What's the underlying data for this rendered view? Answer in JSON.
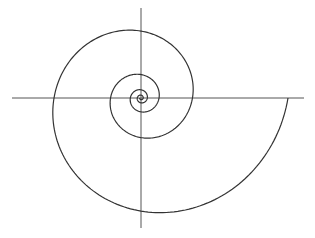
{
  "diagram": {
    "type": "logarithmic-spiral",
    "background": "#ffffff",
    "stroke_color": "#333333",
    "axis_color": "#555555",
    "center": [
      141,
      98
    ],
    "horizontal_axis": {
      "x1": 12,
      "x2": 304,
      "y": 98
    },
    "vertical_axis": {
      "x": 141,
      "y1": 8,
      "y2": 228
    },
    "spiral": {
      "outer_radius": 147,
      "growth_per_quarter_turn": 1.3,
      "start_angle_deg": 0,
      "turns": 4.5
    }
  }
}
